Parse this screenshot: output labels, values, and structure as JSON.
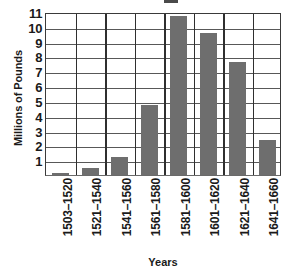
{
  "chart_data": {
    "type": "bar",
    "title": "",
    "xlabel": "Years",
    "ylabel": "Millions of Pounds",
    "categories": [
      "1503–1520",
      "1521–1540",
      "1541–1560",
      "1561–1580",
      "1581–1600",
      "1601–1620",
      "1621–1640",
      "1641–1660"
    ],
    "values": [
      0.15,
      0.5,
      1.2,
      4.75,
      10.7,
      9.6,
      7.6,
      2.35
    ],
    "ylim": [
      0,
      11
    ],
    "ytick_labels": [
      "1",
      "2",
      "3",
      "4",
      "5",
      "6",
      "7",
      "8",
      "9",
      "10",
      "11"
    ],
    "ytick_values": [
      1,
      2,
      3,
      4,
      5,
      6,
      7,
      8,
      9,
      10,
      11
    ],
    "grid": "horizontal-and-vertical",
    "legend": "none",
    "bar_color": "#6e6e6e",
    "gridline_color": "#585858",
    "axis_color": "#2f2f2f",
    "background_color": "#ffffff"
  }
}
